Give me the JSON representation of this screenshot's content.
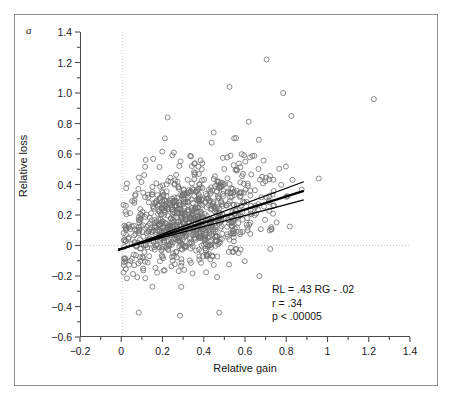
{
  "figure": {
    "panel_label": "a",
    "frame_color": "#8d8d8d",
    "background": "#ffffff"
  },
  "annotation": {
    "equation": "RL = .43 RG - .02",
    "correlation": "r = .34",
    "pvalue": "p < .00005"
  },
  "chart_data": {
    "type": "scatter",
    "title": "",
    "subtitle": "",
    "xlabel": "Relative gain",
    "ylabel": "Relative loss",
    "xlim": [
      -0.2,
      1.4
    ],
    "ylim": [
      -0.6,
      1.4
    ],
    "xticks": [
      -0.2,
      0,
      0.2,
      0.4,
      0.6,
      0.8,
      1,
      1.2,
      1.4
    ],
    "xticklabels": [
      "-0.2",
      "0",
      "0.2",
      "0.4",
      "0.6",
      "0.8",
      "1",
      "1.2",
      "1.4"
    ],
    "yticks": [
      -0.6,
      -0.4,
      -0.2,
      0,
      0.2,
      0.4,
      0.6,
      0.8,
      1.0,
      1.2,
      1.4
    ],
    "yticklabels": [
      "-0.6",
      "-0.4",
      "-0.2",
      "0",
      "0.2",
      "0.4",
      "0.6",
      "0.8",
      "1.0",
      "1.2",
      "1.4"
    ],
    "minor_ticks": true,
    "grid": false,
    "reference_lines": [
      {
        "name": "x-zero-dotted",
        "orientation": "vertical",
        "value": 0,
        "style": "dotted",
        "color": "#c8c8c8"
      },
      {
        "name": "y-zero-dotted",
        "orientation": "horizontal",
        "value": 0,
        "style": "dotted",
        "color": "#c8c8c8"
      }
    ],
    "legend": null,
    "legend_position": "none",
    "marker": {
      "shape": "circle-open",
      "size": 5,
      "color": "#6e6e6e",
      "linewidth": 0.8
    },
    "regression": {
      "slope": 0.43,
      "intercept": -0.02,
      "r": 0.34,
      "p": "< .00005",
      "line_color": "#000000",
      "x_range": [
        -0.02,
        0.88
      ],
      "confidence_bands": [
        {
          "name": "upper-band",
          "slope": 0.5,
          "intercept": -0.022
        },
        {
          "name": "lower-band",
          "slope": 0.36,
          "intercept": -0.018
        }
      ]
    },
    "n_points": 920,
    "notable_points": [
      {
        "x": 0.7,
        "y": 1.22
      },
      {
        "x": 0.52,
        "y": 1.04
      },
      {
        "x": 0.78,
        "y": 1.0
      },
      {
        "x": 1.22,
        "y": 0.96
      },
      {
        "x": 0.22,
        "y": 0.84
      },
      {
        "x": 0.82,
        "y": 0.85
      },
      {
        "x": 0.08,
        "y": -0.44
      },
      {
        "x": 0.28,
        "y": -0.46
      },
      {
        "x": 0.47,
        "y": -0.44
      }
    ],
    "cluster": {
      "center_x": 0.33,
      "center_y": 0.17,
      "spread_x": 0.16,
      "spread_y": 0.15,
      "description": "dense elliptical cloud of open circles concentrated between x 0.1-0.6 and y 0.0-0.4"
    }
  }
}
